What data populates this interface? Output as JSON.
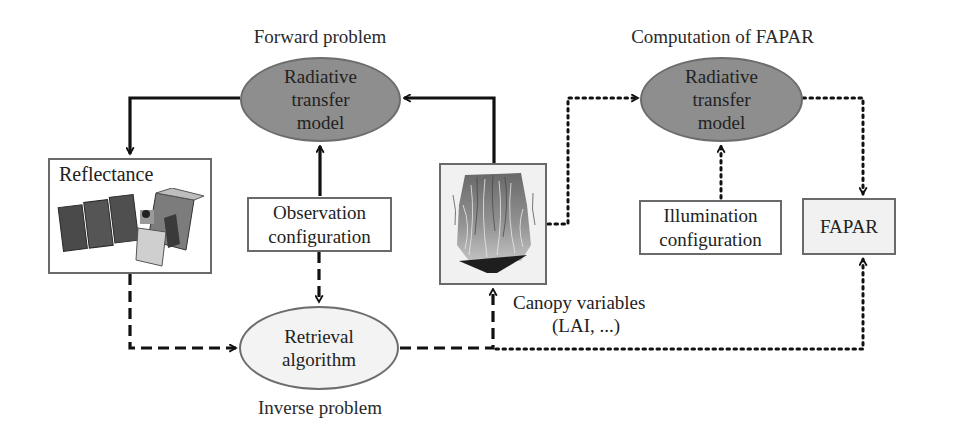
{
  "sections": {
    "forward": {
      "title": "Forward problem"
    },
    "inverse": {
      "title": "Inverse problem"
    },
    "fapar_computation": {
      "title": "Computation of FAPAR"
    }
  },
  "nodes": {
    "rtm_forward": {
      "line1": "Radiative",
      "line2": "transfer",
      "line3": "model"
    },
    "rtm_fapar": {
      "line1": "Radiative",
      "line2": "transfer",
      "line3": "model"
    },
    "retrieval": {
      "line1": "Retrieval",
      "line2": "algorithm"
    },
    "reflectance": {
      "label": "Reflectance",
      "image": "satellite-image"
    },
    "observation": {
      "line1": "Observation",
      "line2": "configuration"
    },
    "canopy": {
      "image": "canopy-vegetation-image",
      "caption1": "Canopy variables",
      "caption2": "(LAI, ...)"
    },
    "illumination": {
      "line1": "Illumination",
      "line2": "configuration"
    },
    "fapar": {
      "label": "FAPAR"
    }
  },
  "edges": [
    {
      "from": "rtm_forward",
      "to": "reflectance",
      "style": "solid"
    },
    {
      "from": "observation",
      "to": "rtm_forward",
      "style": "solid"
    },
    {
      "from": "canopy",
      "to": "rtm_forward",
      "style": "solid"
    },
    {
      "from": "reflectance",
      "to": "retrieval",
      "style": "dashed"
    },
    {
      "from": "observation",
      "to": "retrieval",
      "style": "dashed"
    },
    {
      "from": "retrieval",
      "to": "canopy",
      "style": "dashed"
    },
    {
      "from": "canopy",
      "to": "rtm_fapar",
      "style": "dotted"
    },
    {
      "from": "illumination",
      "to": "rtm_fapar",
      "style": "dotted"
    },
    {
      "from": "rtm_fapar",
      "to": "fapar",
      "style": "dotted"
    },
    {
      "from": "retrieval",
      "to": "fapar",
      "style": "dotted"
    }
  ],
  "legend_styles": {
    "solid": "Forward problem",
    "dashed": "Inverse problem",
    "dotted": "Computation of FAPAR"
  },
  "colors": {
    "ellipse_dark": "#8e8e8e",
    "ellipse_light": "#f3f3f3",
    "line": "#111111",
    "box_border": "#6a6a6a"
  }
}
